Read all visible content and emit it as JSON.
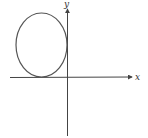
{
  "diagram": {
    "type": "coordinate-plot",
    "axes": {
      "x_label": "x",
      "y_label": "y"
    },
    "shapes": [
      {
        "kind": "ellipse",
        "quadrant": "II",
        "tangent_to": [
          "x-axis",
          "y-axis"
        ]
      }
    ]
  }
}
